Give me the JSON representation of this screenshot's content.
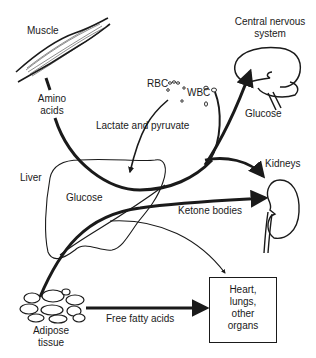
{
  "diagram": {
    "type": "metabolic-flow",
    "colors": {
      "ink": "#1a1a1a",
      "background": "#ffffff"
    },
    "nodes": {
      "muscle": {
        "label": "Muscle"
      },
      "cns": {
        "label_line1": "Central nervous",
        "label_line2": "system"
      },
      "liver": {
        "label": "Liver",
        "inner_label": "Glucose"
      },
      "kidneys": {
        "label": "Kidneys"
      },
      "adipose": {
        "label_line1": "Adipose",
        "label_line2": "tissue"
      },
      "organs_box": {
        "label": "Heart,\nlungs,\nother\norgans"
      },
      "rbc": {
        "label": "RBC"
      },
      "wbc": {
        "label": "WBC"
      }
    },
    "edges": {
      "amino_acids": {
        "label_line1": "Amino",
        "label_line2": "acids",
        "from": "muscle",
        "to": "liver"
      },
      "lactate_pyruvate": {
        "label": "Lactate and pyruvate",
        "from": "rbc",
        "to": "liver"
      },
      "glucose_cns": {
        "label": "Glucose",
        "from": "liver",
        "to": "cns"
      },
      "ketone_bodies": {
        "label": "Ketone bodies",
        "from": "liver",
        "to": "kidneys"
      },
      "free_fatty_acids": {
        "label": "Free fatty acids",
        "from": "adipose",
        "to": "organs_box"
      }
    }
  }
}
